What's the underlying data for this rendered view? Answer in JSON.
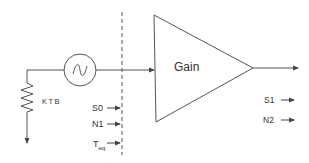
{
  "diagram": {
    "colors": {
      "stroke": "#555555",
      "text": "#333333",
      "background": "#ffffff"
    },
    "amplifier": {
      "label": "Gain"
    },
    "resistor": {
      "label": "KTB"
    },
    "source": {
      "icon": "ac-source-icon"
    },
    "input_labels": {
      "s0": "S0",
      "n1": "N1",
      "teq_main": "T",
      "teq_sub": "eq"
    },
    "output_labels": {
      "s1": "S1",
      "n2": "N2"
    }
  }
}
